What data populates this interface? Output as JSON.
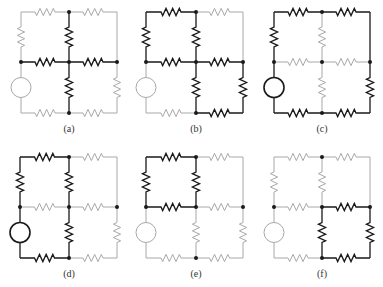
{
  "figure": {
    "colors": {
      "dark": "#1a1a1a",
      "light": "#a8a8a8",
      "background": "#ffffff"
    },
    "panels": [
      {
        "label": "(a)",
        "x": [
          21,
          69,
          117
        ],
        "y": [
          12,
          62,
          113
        ],
        "label_y": 132,
        "dark": [
          "mid_upper",
          "mid_left",
          "mid_right",
          "mid_lower"
        ],
        "dots": [
          "TM",
          "ML",
          "MM",
          "MR",
          "BM"
        ]
      },
      {
        "label": "(b)",
        "x": [
          146,
          196,
          243
        ],
        "y": [
          12,
          62,
          113
        ],
        "label_y": 132,
        "dark": [
          "top_left",
          "left_upper",
          "mid_upper",
          "mid_left",
          "mid_right",
          "mid_lower",
          "right_lower",
          "bot_right"
        ],
        "dots": [
          "TM",
          "ML",
          "MM",
          "MR",
          "BM"
        ]
      },
      {
        "label": "(c)",
        "x": [
          274,
          322,
          370
        ],
        "y": [
          12,
          62,
          113
        ],
        "label_y": 132,
        "dark": [
          "top_left",
          "top_right",
          "left_upper",
          "right_upper",
          "right_lower",
          "bot_left",
          "bot_right",
          "left_lower"
        ],
        "dots": [
          "TM",
          "ML",
          "MM",
          "MR",
          "BM"
        ]
      },
      {
        "label": "(d)",
        "x": [
          20,
          69,
          117
        ],
        "y": [
          157,
          207,
          258
        ],
        "label_y": 277,
        "dark": [
          "top_left",
          "left_upper",
          "mid_upper",
          "left_lower",
          "mid_lower",
          "bot_left"
        ],
        "dots": [
          "TM",
          "ML",
          "MM",
          "MR",
          "BM"
        ]
      },
      {
        "label": "(e)",
        "x": [
          146,
          196,
          243
        ],
        "y": [
          157,
          207,
          258
        ],
        "label_y": 277,
        "dark": [
          "top_left",
          "left_upper",
          "mid_upper",
          "mid_left"
        ],
        "dots": [
          "TM",
          "ML",
          "MM",
          "MR",
          "BM"
        ]
      },
      {
        "label": "(f)",
        "x": [
          274,
          322,
          370
        ],
        "y": [
          157,
          207,
          258
        ],
        "label_y": 277,
        "dark": [
          "mid_right",
          "mid_lower",
          "right_lower",
          "bot_right"
        ],
        "dots": [
          "TM",
          "ML",
          "MM",
          "MR",
          "BM"
        ]
      }
    ],
    "edges": [
      {
        "id": "top_left",
        "from": "TL",
        "to": "TM",
        "kind": "resistor"
      },
      {
        "id": "top_right",
        "from": "TM",
        "to": "TR",
        "kind": "resistor"
      },
      {
        "id": "left_upper",
        "from": "TL",
        "to": "ML",
        "kind": "resistor"
      },
      {
        "id": "mid_upper",
        "from": "TM",
        "to": "MM",
        "kind": "resistor"
      },
      {
        "id": "right_upper",
        "from": "TR",
        "to": "MR",
        "kind": "wire"
      },
      {
        "id": "mid_left",
        "from": "ML",
        "to": "MM",
        "kind": "resistor"
      },
      {
        "id": "mid_right",
        "from": "MM",
        "to": "MR",
        "kind": "resistor"
      },
      {
        "id": "left_lower",
        "from": "ML",
        "to": "BL",
        "kind": "source"
      },
      {
        "id": "mid_lower",
        "from": "MM",
        "to": "BM",
        "kind": "resistor"
      },
      {
        "id": "right_lower",
        "from": "MR",
        "to": "BR",
        "kind": "resistor"
      },
      {
        "id": "bot_left",
        "from": "BL",
        "to": "BM",
        "kind": "resistor"
      },
      {
        "id": "bot_right",
        "from": "BM",
        "to": "BR",
        "kind": "resistor"
      }
    ]
  }
}
